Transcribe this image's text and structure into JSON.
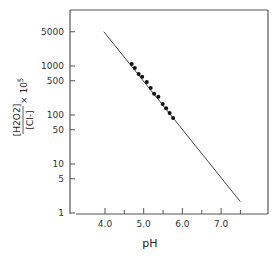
{
  "chart_data": {
    "type": "scatter",
    "title": "",
    "xlabel": "pH",
    "ylabel": {
      "numerator": "H2O2",
      "denominator": "Cl-",
      "multiplier": "× 10",
      "exponent": "5",
      "full": "[H2O2]/[Cl-] × 10^5"
    },
    "xlim": [
      3.4,
      8.7
    ],
    "ylim": [
      1,
      10000
    ],
    "yscale": "log",
    "grid": false,
    "x_ticks": [
      {
        "value": 4.0,
        "label": "4.0"
      },
      {
        "value": 4.5,
        "label": ""
      },
      {
        "value": 5.0,
        "label": "5.0"
      },
      {
        "value": 5.5,
        "label": ""
      },
      {
        "value": 6.0,
        "label": "6.0"
      },
      {
        "value": 6.5,
        "label": ""
      },
      {
        "value": 7.0,
        "label": "7.0"
      },
      {
        "value": 7.5,
        "label": ""
      }
    ],
    "y_ticks": [
      {
        "value": 1,
        "label": "1"
      },
      {
        "value": 5,
        "label": "5"
      },
      {
        "value": 10,
        "label": "10"
      },
      {
        "value": 50,
        "label": "50"
      },
      {
        "value": 100,
        "label": "100"
      },
      {
        "value": 500,
        "label": "500"
      },
      {
        "value": 1000,
        "label": "1000"
      },
      {
        "value": 5000,
        "label": "5000"
      }
    ],
    "series": [
      {
        "name": "measured",
        "marker": "filled-circle",
        "x": [
          4.69,
          4.77,
          4.87,
          4.96,
          5.08,
          5.18,
          5.27,
          5.38,
          5.49,
          5.58,
          5.67,
          5.76
        ],
        "y": [
          1100,
          910,
          690,
          600,
          470,
          355,
          270,
          235,
          167,
          138,
          110,
          87
        ]
      },
      {
        "name": "fit-line",
        "marker": "line",
        "x": [
          3.97,
          7.5
        ],
        "y": [
          5000,
          1.7
        ]
      }
    ]
  }
}
